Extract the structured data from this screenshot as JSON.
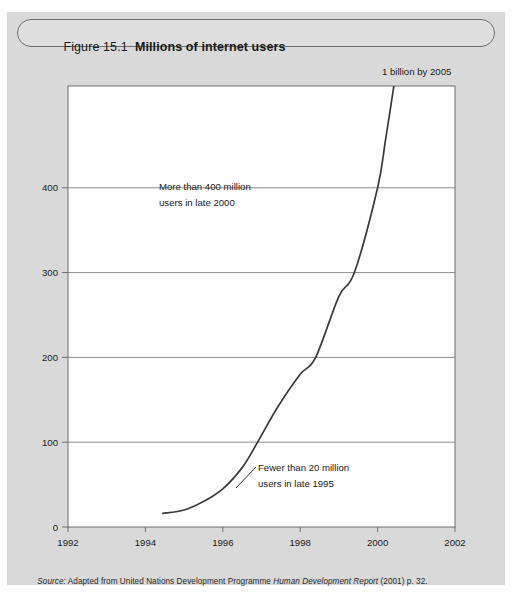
{
  "figure": {
    "number_label": "Figure 15.1",
    "title": "Millions of internet users",
    "source_prefix": "Source:",
    "source_body_1": " Adapted from United Nations Development Programme ",
    "source_italic": "Human Development Report",
    "source_body_2": " (2001) p. 32.",
    "source_full": "Source: Adapted from United Nations Development Programme Human Development Report (2001) p. 32."
  },
  "colors": {
    "panel_background": "#d9d9d9",
    "plot_background": "#ffffff",
    "axis": "#6e6e6e",
    "gridline": "#8c8c8c",
    "curve": "#3a3a3a",
    "text": "#1b1b1b",
    "title_box_fill": "#dedede"
  },
  "chart_data": {
    "type": "line",
    "title": "Millions of internet users",
    "xlabel": "",
    "ylabel": "",
    "xlim": [
      1992,
      2002
    ],
    "ylim": [
      0,
      520
    ],
    "xticks": [
      1992,
      1994,
      1996,
      1998,
      2000,
      2002
    ],
    "xticklabels": [
      "1992",
      "1994",
      "1996",
      "1998",
      "2000",
      "2002"
    ],
    "yticks": [
      0,
      100,
      200,
      300,
      400
    ],
    "yticklabels": [
      "0",
      "100",
      "200",
      "300",
      "400"
    ],
    "grid": "horizontal",
    "legend": "none",
    "series": [
      {
        "name": "Millions of internet users",
        "x": [
          1994.45,
          1995.0,
          1995.5,
          1996.0,
          1996.5,
          1996.9,
          1997.4,
          1998.0,
          1998.4,
          1999.0,
          1999.4,
          2000.0,
          2000.2,
          2000.42
        ],
        "y": [
          16,
          20,
          30,
          45,
          70,
          100,
          140,
          180,
          200,
          272,
          300,
          400,
          455,
          520
        ]
      }
    ],
    "annotations": [
      {
        "name": "annotation-1-billion",
        "text": "1 billion by 2005",
        "x": 2000.8,
        "y": 560,
        "position": "above-plot-right"
      },
      {
        "name": "annotation-400-million",
        "line1": "More than 400 million",
        "line2": "users in late 2000",
        "x": 1996.9,
        "y": 405,
        "position": "inside-upper-left"
      },
      {
        "name": "annotation-20-million",
        "line1": "Fewer than 20 million",
        "line2": "users in late 1995",
        "x": 1998.1,
        "y": 60,
        "position": "inside-lower-right",
        "has_leader_line": true
      }
    ]
  }
}
